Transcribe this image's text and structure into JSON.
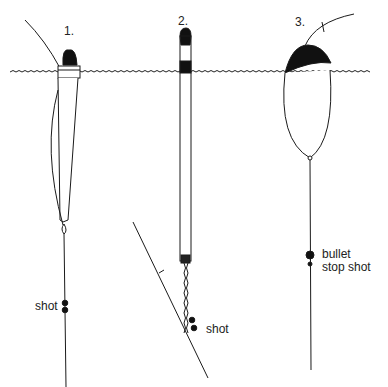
{
  "diagram": {
    "floats": [
      {
        "number": "1.",
        "labels": [
          "shot"
        ]
      },
      {
        "number": "2.",
        "labels": [
          "shot"
        ]
      },
      {
        "number": "3.",
        "labels": [
          "bullet",
          "stop shot"
        ]
      }
    ],
    "colors": {
      "ink": "#1a1a1a",
      "background": "#ffffff"
    }
  }
}
